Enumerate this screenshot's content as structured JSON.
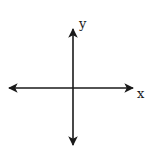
{
  "diagram": {
    "type": "cartesian-axes",
    "colors": {
      "background": "#ffffff",
      "axis": "#1a1a1a"
    },
    "origin": {
      "x": 73,
      "y": 88
    },
    "x_axis": {
      "label": "x",
      "from": {
        "x": 8,
        "y": 88
      },
      "to": {
        "x": 134,
        "y": 88
      },
      "arrowheads": [
        "left",
        "right"
      ]
    },
    "y_axis": {
      "label": "y",
      "from": {
        "x": 73,
        "y": 146
      },
      "to": {
        "x": 73,
        "y": 28
      },
      "arrowheads": [
        "up",
        "down"
      ]
    }
  }
}
